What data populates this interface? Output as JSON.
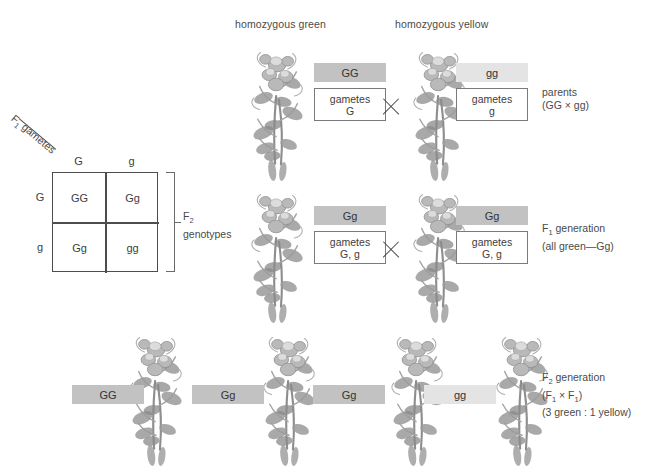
{
  "figure": {
    "header_labels": {
      "parent_left": "homozygous green",
      "parent_right": "homozygous yellow"
    },
    "annotations": {
      "parents": [
        "parents",
        "(GG × gg)"
      ],
      "f1": [
        "F₁ generation",
        "(all green—Gg)"
      ],
      "f2": [
        "F₂ generation",
        "(F₁ × F₁)",
        "(3 green : 1 yellow)"
      ]
    },
    "rows": {
      "parents": {
        "left": {
          "genotype": "GG",
          "gametes_label": "gametes",
          "gametes_value": "G",
          "shade": "dark"
        },
        "right": {
          "genotype": "gg",
          "gametes_label": "gametes",
          "gametes_value": "g",
          "shade": "light"
        },
        "cross": "×"
      },
      "f1": {
        "left": {
          "genotype": "Gg",
          "gametes_label": "gametes",
          "gametes_value": "G, g",
          "shade": "dark"
        },
        "right": {
          "genotype": "Gg",
          "gametes_label": "gametes",
          "gametes_value": "G, g",
          "shade": "dark"
        },
        "cross": "×"
      },
      "f2": {
        "offspring": [
          {
            "genotype": "GG",
            "shade": "dark"
          },
          {
            "genotype": "Gg",
            "shade": "dark"
          },
          {
            "genotype": "Gg",
            "shade": "dark"
          },
          {
            "genotype": "gg",
            "shade": "light"
          }
        ]
      }
    },
    "punnett": {
      "diagonal_label_parts": {
        "pre": "F",
        "sub": "1",
        "post": " gametes"
      },
      "column_headers": [
        "G",
        "g"
      ],
      "row_headers": [
        "G",
        "g"
      ],
      "cells": [
        [
          "GG",
          "Gg"
        ],
        [
          "Gg",
          "gg"
        ]
      ],
      "bracket_label_line1_pre": "F",
      "bracket_label_line1_sub": "2",
      "bracket_label_line2": "genotypes"
    },
    "colors": {
      "genotype_dark": "#c2c2c2",
      "genotype_light": "#e4e4e4",
      "line": "#4d4d4d",
      "text": "#4a4a4a"
    }
  }
}
